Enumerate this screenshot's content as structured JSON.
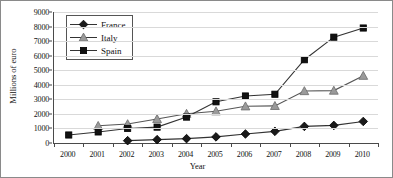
{
  "chart_data": {
    "type": "line",
    "title": "",
    "xlabel": "Year",
    "ylabel": "Millions of euro",
    "categories": [
      "2000",
      "2001",
      "2002",
      "2003",
      "2004",
      "2005",
      "2006",
      "2007",
      "2008",
      "2009",
      "2010"
    ],
    "x_ticks": [
      "2000",
      "2001",
      "2002",
      "2003",
      "2004",
      "2005",
      "2006",
      "2007",
      "2008",
      "2009",
      "2010"
    ],
    "y_ticks": [
      "0",
      "1000",
      "2000",
      "3000",
      "4000",
      "5000",
      "6000",
      "7000",
      "8000",
      "9000"
    ],
    "ylim": [
      0,
      9000
    ],
    "y_tick_step": 1000,
    "grid": "horizontal",
    "legend_position": "upper-left-inside",
    "series": [
      {
        "name": "France",
        "marker": "diamond",
        "color": "#1a1a1a",
        "line_color": "#333333",
        "x": [
          "2002",
          "2003",
          "2004",
          "2005",
          "2006",
          "2007",
          "2008",
          "2009",
          "2010"
        ],
        "values": [
          160,
          230,
          300,
          420,
          620,
          800,
          1140,
          1210,
          1480
        ]
      },
      {
        "name": "Italy",
        "marker": "triangle",
        "color": "#9a9a9a",
        "line_color": "#555555",
        "x": [
          "2001",
          "2002",
          "2003",
          "2004",
          "2005",
          "2006",
          "2007",
          "2008",
          "2009",
          "2010"
        ],
        "values": [
          1180,
          1300,
          1650,
          2010,
          2180,
          2520,
          2550,
          3570,
          3600,
          4620
        ]
      },
      {
        "name": "Spain",
        "marker": "square",
        "color": "#111111",
        "line_color": "#333333",
        "x": [
          "2000",
          "2001",
          "2002",
          "2003",
          "2004",
          "2005",
          "2006",
          "2007",
          "2008",
          "2009",
          "2010"
        ],
        "values": [
          550,
          760,
          1000,
          1090,
          1780,
          2830,
          3230,
          3350,
          5720,
          7270,
          7900
        ]
      }
    ]
  },
  "legend": {
    "items": [
      {
        "label": "France"
      },
      {
        "label": "Italy"
      },
      {
        "label": "Spain"
      }
    ]
  },
  "axes": {
    "y_title": "Millions of euro",
    "x_title": "Year"
  }
}
